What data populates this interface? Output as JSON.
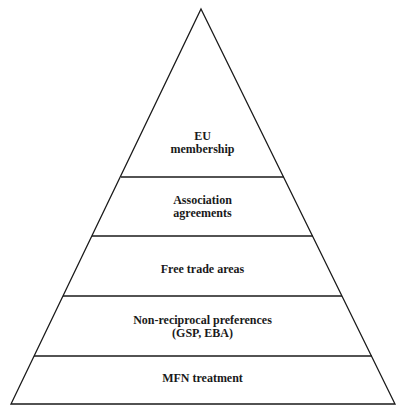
{
  "diagram": {
    "type": "pyramid",
    "levels": [
      {
        "lines": [
          "EU",
          "membership"
        ]
      },
      {
        "lines": [
          "Association",
          "agreements"
        ]
      },
      {
        "lines": [
          "Free trade areas"
        ]
      },
      {
        "lines": [
          "Non-reciprocal preferences",
          "(GSP, EBA)"
        ]
      },
      {
        "lines": [
          "MFN treatment"
        ]
      }
    ],
    "colors": {
      "stroke": "#1a1a1a",
      "background": "#ffffff"
    }
  }
}
